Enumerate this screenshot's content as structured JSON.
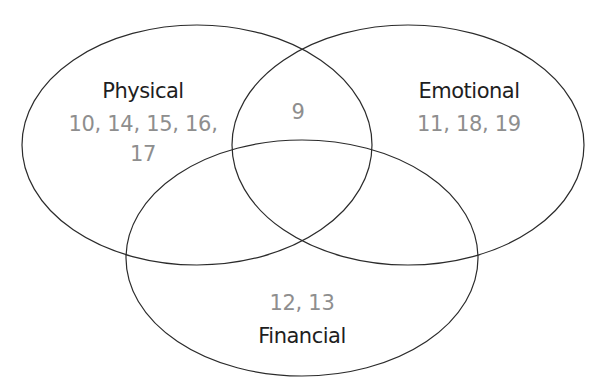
{
  "diagram": {
    "type": "venn",
    "stroke_color": "#2b2b2b",
    "name_color": "#1e1e1e",
    "item_color": "#8e8e8e",
    "sets": [
      {
        "name": "Physical",
        "items_line1": "10, 14, 15, 16,",
        "items_line2": "17"
      },
      {
        "name": "Emotional",
        "items_line1": "11, 18, 19"
      },
      {
        "name": "Financial",
        "items_line1": "12, 13"
      }
    ],
    "intersections": [
      {
        "sets": [
          "Physical",
          "Emotional"
        ],
        "items": "9"
      }
    ]
  }
}
